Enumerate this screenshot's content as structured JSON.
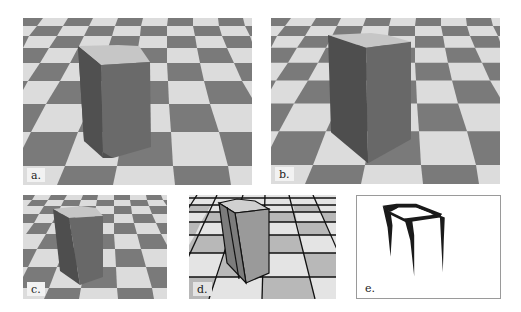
{
  "figure": {
    "panels": [
      {
        "id": "a",
        "label": "a.",
        "content": "box on checkerboard floor, shaded render"
      },
      {
        "id": "b",
        "label": "b.",
        "content": "box on checkerboard floor, shaded render (variant)"
      },
      {
        "id": "c",
        "label": "c.",
        "content": "box on checkerboard floor, smaller view"
      },
      {
        "id": "d",
        "label": "d.",
        "content": "box on grid floor with outlined edges"
      },
      {
        "id": "e",
        "label": "e.",
        "content": "line drawing of box silhouette edges"
      }
    ],
    "colors": {
      "tile_dark": "#7a7a7a",
      "tile_light": "#dcdcdc",
      "box_left": "#5a5a5a",
      "box_right": "#6e6e6e",
      "box_top": "#c8c8c8",
      "grid_line": "#111111",
      "ink": "#1a1a1a"
    }
  }
}
